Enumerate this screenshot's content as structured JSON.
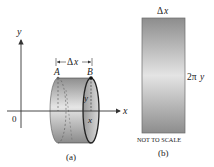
{
  "panel_a": {
    "caption": "(a)",
    "y_axis_label": "y",
    "x_axis_label": "x",
    "origin_label": "0",
    "point_a_label": "A",
    "point_b_label": "B",
    "radius_label": "y",
    "position_label": "x",
    "width_label": "|←Δx→|",
    "width_label_delta": "Δ",
    "width_label_x": "x"
  },
  "panel_b": {
    "caption": "(b)",
    "top_label_delta": "Δ",
    "top_label_x": "x",
    "side_label_prefix": "2π",
    "side_label_var": "y",
    "note": "NOT TO SCALE"
  },
  "colors": {
    "axis": "#333333",
    "outline": "#222222",
    "shade_dark": "#8a8a8a",
    "shade_light": "#e2e2e2",
    "dashed": "#555555"
  }
}
